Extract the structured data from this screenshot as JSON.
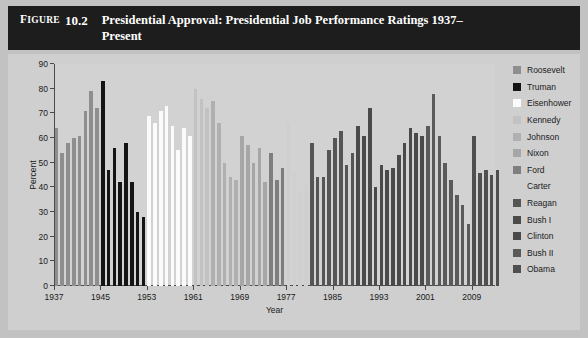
{
  "figure": {
    "label": "Figure",
    "number": "10.2",
    "title": "Presidential Approval: Presidential Job Performance Ratings 1937–Present"
  },
  "chart_data": {
    "type": "bar",
    "title": "Presidential Approval: Presidential Job Performance Ratings 1937–Present",
    "xlabel": "Year",
    "ylabel": "Percent",
    "ylim": [
      0,
      90
    ],
    "ytick_step": 10,
    "yticks": [
      0,
      10,
      20,
      30,
      40,
      50,
      60,
      70,
      80,
      90
    ],
    "xticks": [
      1937,
      1945,
      1953,
      1961,
      1969,
      1977,
      1985,
      1993,
      2001,
      2009
    ],
    "xlim": [
      1937,
      2013
    ],
    "grid": false,
    "legend_position": "right",
    "series": [
      {
        "name": "Roosevelt",
        "color": "#8e8e8e",
        "x": [
          1937,
          1938,
          1939,
          1940,
          1941,
          1942,
          1943,
          1944
        ],
        "values": [
          64,
          54,
          58,
          60,
          61,
          71,
          79,
          72
        ]
      },
      {
        "name": "Truman",
        "color": "#141414",
        "x": [
          1945,
          1946,
          1947,
          1948,
          1949,
          1950,
          1951,
          1952
        ],
        "values": [
          83,
          47,
          56,
          42,
          58,
          42,
          30,
          28
        ]
      },
      {
        "name": "Eisenhower",
        "color": "#fbfbfb",
        "x": [
          1953,
          1954,
          1955,
          1956,
          1957,
          1958,
          1959,
          1960
        ],
        "values": [
          69,
          66,
          71,
          73,
          65,
          55,
          64,
          61
        ]
      },
      {
        "name": "Kennedy",
        "color": "#c2c2c2",
        "x": [
          1961,
          1962,
          1963
        ],
        "values": [
          80,
          76,
          72
        ]
      },
      {
        "name": "Johnson",
        "color": "#b0b0b0",
        "x": [
          1964,
          1965,
          1966,
          1967,
          1968
        ],
        "values": [
          75,
          66,
          50,
          44,
          43
        ]
      },
      {
        "name": "Nixon",
        "color": "#a6a6a6",
        "x": [
          1969,
          1970,
          1971,
          1972,
          1973,
          1974
        ],
        "values": [
          61,
          57,
          50,
          56,
          42,
          24
        ]
      },
      {
        "name": "Ford",
        "color": "#7e7e7e",
        "x": [
          1974,
          1975,
          1976
        ],
        "values": [
          54,
          43,
          48
        ]
      },
      {
        "name": "Carter",
        "color": "#cfcfcf",
        "x": [
          1977,
          1978,
          1979,
          1980
        ],
        "values": [
          66,
          46,
          38,
          41
        ]
      },
      {
        "name": "Reagan",
        "color": "#555555",
        "x": [
          1981,
          1982,
          1983,
          1984,
          1985,
          1986,
          1987,
          1988
        ],
        "values": [
          58,
          44,
          44,
          55,
          60,
          63,
          49,
          54
        ]
      },
      {
        "name": "Bush I",
        "color": "#4a4a4a",
        "x": [
          1989,
          1990,
          1991,
          1992
        ],
        "values": [
          65,
          61,
          72,
          40
        ]
      },
      {
        "name": "Clinton",
        "color": "#4a4a4a",
        "x": [
          1993,
          1994,
          1995,
          1996,
          1997,
          1998,
          1999,
          2000
        ],
        "values": [
          49,
          47,
          48,
          53,
          58,
          64,
          62,
          61
        ]
      },
      {
        "name": "Bush II",
        "color": "#5a5a5a",
        "x": [
          2001,
          2002,
          2003,
          2004,
          2005,
          2006,
          2007,
          2008
        ],
        "values": [
          65,
          78,
          61,
          50,
          43,
          37,
          33,
          25
        ]
      },
      {
        "name": "Obama",
        "color": "#4f4f4f",
        "x": [
          2009,
          2010,
          2011,
          2012,
          2013
        ],
        "values": [
          61,
          46,
          47,
          45,
          47
        ]
      }
    ]
  },
  "legend": {
    "items": [
      {
        "label": "Roosevelt",
        "color": "#8e8e8e"
      },
      {
        "label": "Truman",
        "color": "#141414"
      },
      {
        "label": "Eisenhower",
        "color": "#fbfbfb"
      },
      {
        "label": "Kennedy",
        "color": "#c2c2c2"
      },
      {
        "label": "Johnson",
        "color": "#b0b0b0"
      },
      {
        "label": "Nixon",
        "color": "#a6a6a6"
      },
      {
        "label": "Ford",
        "color": "#7e7e7e"
      },
      {
        "label": "Carter",
        "color": "#cfcfcf"
      },
      {
        "label": "Reagan",
        "color": "#555555"
      },
      {
        "label": "Bush I",
        "color": "#4a4a4a"
      },
      {
        "label": "Clinton",
        "color": "#4a4a4a"
      },
      {
        "label": "Bush II",
        "color": "#5a5a5a"
      },
      {
        "label": "Obama",
        "color": "#4f4f4f"
      }
    ]
  }
}
